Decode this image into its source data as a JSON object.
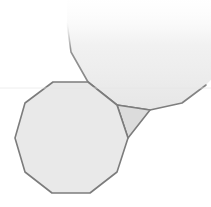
{
  "diagram": {
    "shapes": [
      {
        "id": "lower-decagon",
        "kind": "decagon",
        "sides": 10,
        "fill": "#e9e9e9",
        "stroke": "#7c7c7c"
      },
      {
        "id": "upper-decagon",
        "kind": "decagon",
        "sides": 10,
        "fill": "#eeeeee",
        "stroke": "#7c7c7c",
        "faded": true
      },
      {
        "id": "gap-triangle",
        "kind": "triangle",
        "sides": 3,
        "fill": "#dcdcdc",
        "stroke": "#7c7c7c"
      }
    ],
    "background": "#ffffff"
  }
}
